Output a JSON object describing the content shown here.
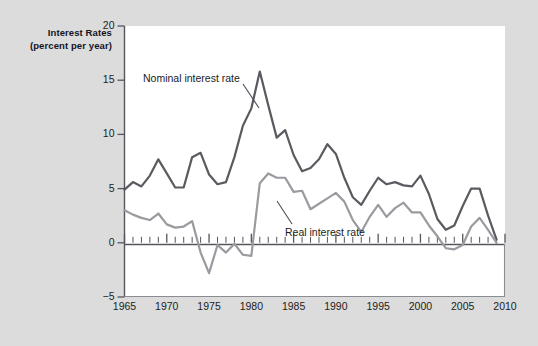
{
  "figure": {
    "background_color": "#dcdcdc",
    "plot_background_color": "#ffffff",
    "axis_title_line1": "Interest Rates",
    "axis_title_line2": "(percent per year)"
  },
  "chart_data": {
    "type": "line",
    "title": "",
    "subtitle": "",
    "xlabel": "",
    "ylabel": "Interest Rates (percent per year)",
    "xlim": [
      1965,
      2010
    ],
    "ylim": [
      -5,
      20
    ],
    "yticks": [
      -5,
      0,
      5,
      10,
      15,
      20
    ],
    "ytick_labels": [
      "−5",
      "0",
      "5",
      "10",
      "15",
      "20"
    ],
    "xticks": [
      1965,
      1970,
      1975,
      1980,
      1985,
      1990,
      1995,
      2000,
      2005,
      2010
    ],
    "xtick_labels": [
      "1965",
      "1970",
      "1975",
      "1980",
      "1985",
      "1990",
      "1995",
      "2000",
      "2005",
      "2010"
    ],
    "minor_xtick_interval": 1,
    "grid": false,
    "legend_position": "inline-annotation",
    "zero_line": true,
    "x": [
      1965,
      1966,
      1967,
      1968,
      1969,
      1970,
      1971,
      1972,
      1973,
      1974,
      1975,
      1976,
      1977,
      1978,
      1979,
      1980,
      1981,
      1982,
      1983,
      1984,
      1985,
      1986,
      1987,
      1988,
      1989,
      1990,
      1991,
      1992,
      1993,
      1994,
      1995,
      1996,
      1997,
      1998,
      1999,
      2000,
      2001,
      2002,
      2003,
      2004,
      2005,
      2006,
      2007,
      2008,
      2009
    ],
    "series": [
      {
        "name": "Nominal interest rate",
        "color": "#5a5a60",
        "values": [
          4.9,
          5.6,
          5.2,
          6.2,
          7.7,
          6.4,
          5.1,
          5.1,
          7.9,
          8.3,
          6.3,
          5.4,
          5.6,
          7.9,
          10.8,
          12.4,
          15.8,
          12.7,
          9.7,
          10.4,
          8.1,
          6.6,
          6.9,
          7.7,
          9.1,
          8.2,
          6.0,
          4.2,
          3.5,
          4.8,
          6.0,
          5.4,
          5.6,
          5.3,
          5.2,
          6.2,
          4.5,
          2.2,
          1.2,
          1.6,
          3.4,
          5.0,
          5.0,
          2.5,
          0.3
        ],
        "peak": {
          "year": 1981,
          "value": 15.8
        }
      },
      {
        "name": "Real interest rate",
        "color": "#9a9aa0",
        "values": [
          3.0,
          2.6,
          2.3,
          2.1,
          2.7,
          1.7,
          1.4,
          1.5,
          2.0,
          -0.9,
          -2.8,
          -0.2,
          -0.9,
          -0.1,
          -1.1,
          -1.2,
          5.5,
          6.4,
          6.0,
          6.0,
          4.7,
          4.8,
          3.1,
          3.6,
          4.1,
          4.6,
          3.8,
          2.1,
          1.0,
          2.4,
          3.5,
          2.4,
          3.2,
          3.7,
          2.8,
          2.8,
          1.6,
          0.6,
          -0.5,
          -0.6,
          -0.2,
          1.5,
          2.3,
          1.2,
          0.0
        ]
      }
    ],
    "annotations": [
      {
        "text": "Nominal interest rate",
        "x_px": 143,
        "y_px": 72
      },
      {
        "text": "Real interest rate",
        "x_px": 285,
        "y_px": 226
      }
    ]
  }
}
